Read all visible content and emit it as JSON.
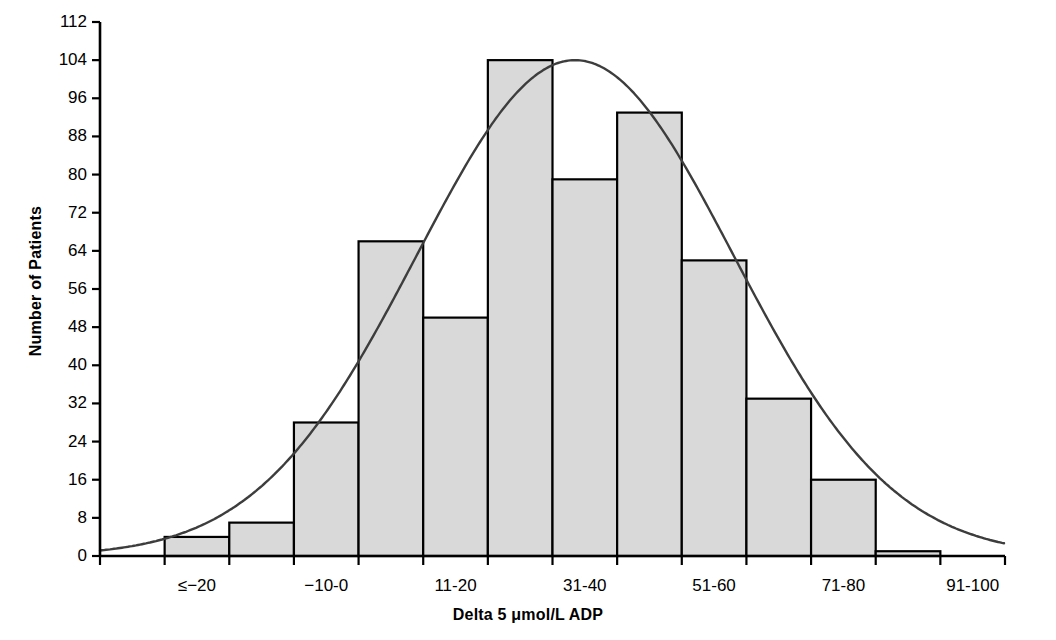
{
  "chart_data": {
    "type": "bar",
    "title": "",
    "subtitle": "",
    "xlabel": "Delta 5 μmol/L ADP",
    "ylabel": "Number of Patients",
    "categories": [
      "≤20",
      "-19--10",
      "-10-0",
      "1-10",
      "11-20",
      "21-30",
      "31-40",
      "41-50",
      "51-60",
      "61-70",
      "71-80",
      "81-90",
      "91-100",
      "≥101"
    ],
    "bin_labels_shown": [
      "≤−20",
      "−10-0",
      "11-20",
      "31-40",
      "51-60",
      "71-80",
      "91-100"
    ],
    "values": [
      0,
      4,
      7,
      28,
      66,
      50,
      104,
      79,
      93,
      62,
      33,
      16,
      1,
      0
    ],
    "bars": [
      {
        "label": "-19--10",
        "value": 4
      },
      {
        "label": "-10-0",
        "value": 7
      },
      {
        "label": "1-10",
        "value": 28
      },
      {
        "label": "11-20",
        "value": 66
      },
      {
        "label": "21-30",
        "value": 50
      },
      {
        "label": "31-40",
        "value": 104
      },
      {
        "label": "41-50",
        "value": 79
      },
      {
        "label": "51-60",
        "value": 93
      },
      {
        "label": "61-70",
        "value": 62
      },
      {
        "label": "71-80",
        "value": 33
      },
      {
        "label": "81-90",
        "value": 16
      },
      {
        "label": "91-100",
        "value": 1
      }
    ],
    "ylim": [
      0,
      112
    ],
    "yticks": [
      0,
      8,
      16,
      24,
      32,
      40,
      48,
      56,
      64,
      72,
      80,
      88,
      96,
      104,
      112
    ],
    "ytick_labels": [
      "0",
      "8",
      "16",
      "24",
      "32",
      "40",
      "48",
      "56",
      "64",
      "72",
      "80",
      "88",
      "96",
      "104",
      "112"
    ],
    "xtick_labels": [
      "≤−20",
      "−10-0",
      "11-20",
      "31-40",
      "51-60",
      "71-80",
      "91-100"
    ],
    "grid": false,
    "legend": "none",
    "overlay": {
      "type": "line",
      "name": "normal-distribution-curve",
      "mean_bin_index": 6.35,
      "peak_value": 104,
      "sigma_bins": 2.45,
      "color": "#3d3d3d"
    },
    "colors": {
      "bar_fill": "#d9d9d9",
      "bar_stroke": "#000000",
      "axis": "#000000",
      "curve": "#3d3d3d",
      "text": "#000000"
    }
  }
}
